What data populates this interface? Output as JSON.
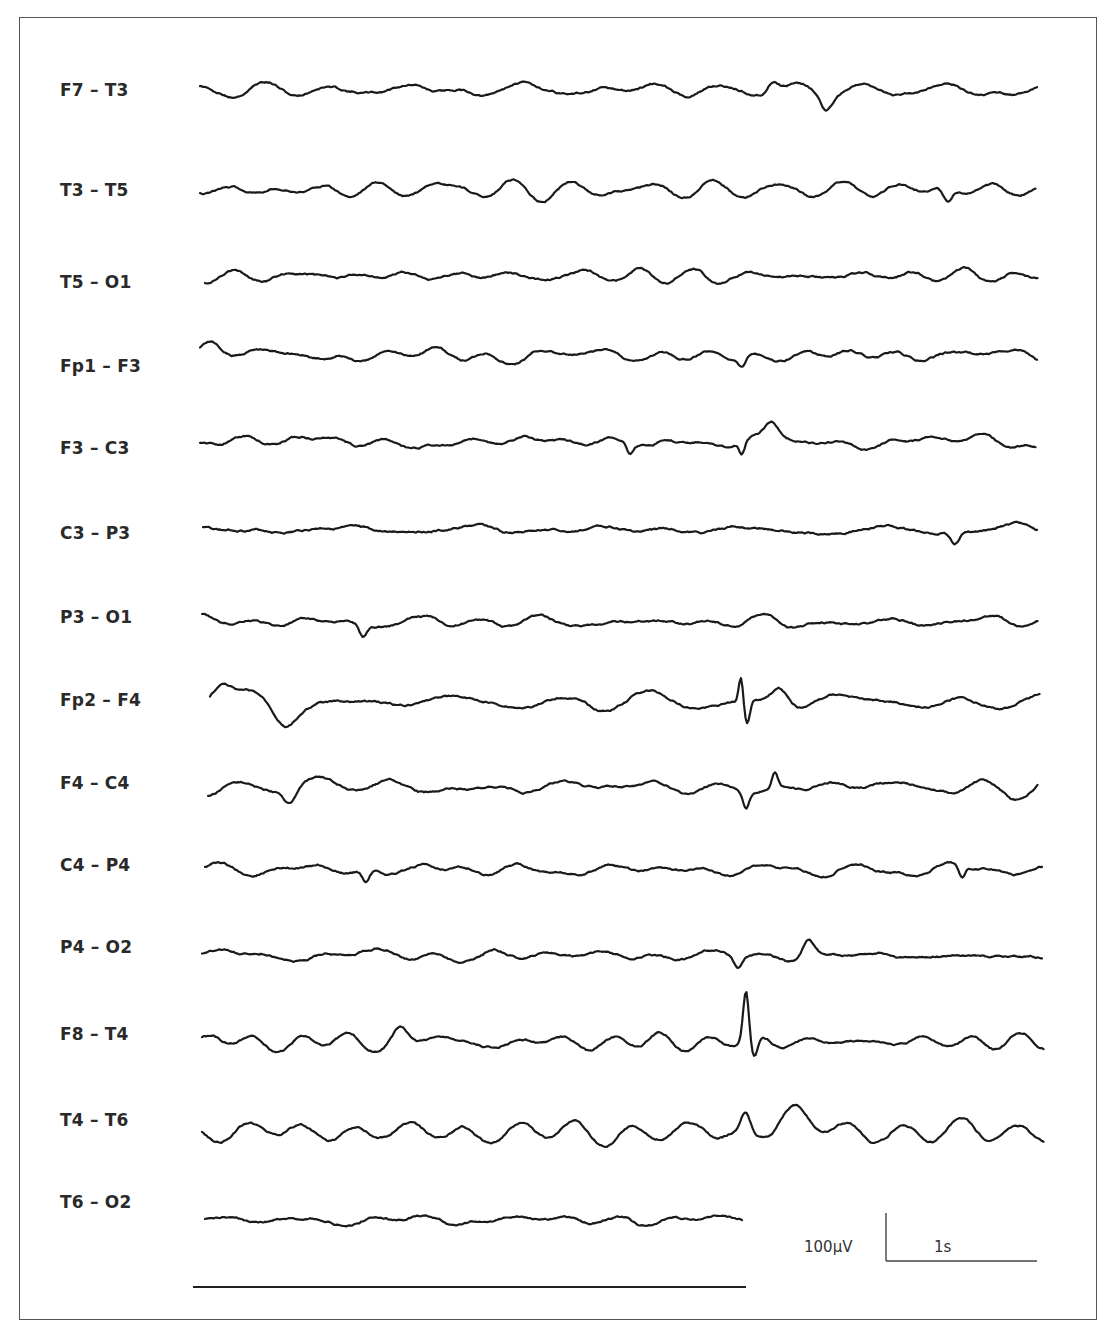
{
  "chart_data": {
    "type": "line",
    "title": "",
    "subtitle": "EEG bipolar montage (longitudinal) — 14 channels",
    "xlabel": "",
    "ylabel": "",
    "grid": false,
    "legend": "none",
    "scale_bar": {
      "amplitude_label": "100µV",
      "time_label": "1s",
      "amplitude_uV": 100,
      "time_s": 1
    },
    "series": [
      {
        "name": "F7 – T3",
        "baseline_y": 90,
        "amp": 9,
        "x0": 200,
        "x1": 1038,
        "seed": 11,
        "events": [
          {
            "x": 826,
            "dy": 14,
            "w": 8
          },
          {
            "x": 773,
            "dy": -12,
            "w": 8
          }
        ]
      },
      {
        "name": "T3 – T5",
        "baseline_y": 190,
        "amp": 9,
        "x0": 200,
        "x1": 1036,
        "seed": 23,
        "events": [
          {
            "x": 948,
            "dy": 14,
            "w": 6
          }
        ]
      },
      {
        "name": "T5 – O1",
        "baseline_y": 276,
        "amp": 6,
        "x0": 205,
        "x1": 1038,
        "seed": 37,
        "events": []
      },
      {
        "name": "Fp1 – F3",
        "baseline_y": 355,
        "amp": 8,
        "x0": 200,
        "x1": 1038,
        "seed": 41,
        "events": [
          {
            "x": 210,
            "dy": -14,
            "w": 14
          },
          {
            "x": 742,
            "dy": 10,
            "w": 5
          }
        ]
      },
      {
        "name": "F3 – C3",
        "baseline_y": 442,
        "amp": 9,
        "x0": 200,
        "x1": 1036,
        "seed": 53,
        "events": [
          {
            "x": 772,
            "dy": -20,
            "w": 10
          },
          {
            "x": 742,
            "dy": 12,
            "w": 4
          },
          {
            "x": 630,
            "dy": 10,
            "w": 4
          }
        ]
      },
      {
        "name": "C3 – P3",
        "baseline_y": 530,
        "amp": 6,
        "x0": 203,
        "x1": 1038,
        "seed": 67,
        "events": [
          {
            "x": 955,
            "dy": 12,
            "w": 6
          }
        ]
      },
      {
        "name": "P3 – O1",
        "baseline_y": 622,
        "amp": 7,
        "x0": 202,
        "x1": 1038,
        "seed": 79,
        "events": [
          {
            "x": 363,
            "dy": 12,
            "w": 5
          }
        ]
      },
      {
        "name": "Fp2 – F4",
        "baseline_y": 702,
        "amp": 9,
        "x0": 210,
        "x1": 1040,
        "seed": 83,
        "events": [
          {
            "x": 220,
            "dy": -18,
            "w": 14
          },
          {
            "x": 285,
            "dy": 18,
            "w": 16
          },
          {
            "x": 741,
            "dy": -24,
            "w": 3
          },
          {
            "x": 747,
            "dy": 24,
            "w": 4
          },
          {
            "x": 780,
            "dy": -18,
            "w": 12
          }
        ]
      },
      {
        "name": "F4 – C4",
        "baseline_y": 787,
        "amp": 9,
        "x0": 208,
        "x1": 1038,
        "seed": 97,
        "events": [
          {
            "x": 290,
            "dy": 14,
            "w": 8
          },
          {
            "x": 775,
            "dy": -14,
            "w": 4
          },
          {
            "x": 746,
            "dy": 14,
            "w": 4
          }
        ]
      },
      {
        "name": "C4 – P4",
        "baseline_y": 870,
        "amp": 7,
        "x0": 205,
        "x1": 1042,
        "seed": 101,
        "events": [
          {
            "x": 366,
            "dy": 12,
            "w": 5
          },
          {
            "x": 962,
            "dy": 12,
            "w": 4
          }
        ]
      },
      {
        "name": "P4 – O2",
        "baseline_y": 955,
        "amp": 7,
        "x0": 202,
        "x1": 1042,
        "seed": 113,
        "events": [
          {
            "x": 808,
            "dy": -18,
            "w": 8
          },
          {
            "x": 738,
            "dy": 12,
            "w": 6
          }
        ]
      },
      {
        "name": "F8 – T4",
        "baseline_y": 1042,
        "amp": 11,
        "x0": 202,
        "x1": 1044,
        "seed": 127,
        "events": [
          {
            "x": 746,
            "dy": -50,
            "w": 4
          },
          {
            "x": 754,
            "dy": 22,
            "w": 5
          },
          {
            "x": 400,
            "dy": -14,
            "w": 10
          }
        ]
      },
      {
        "name": "T4 – T6",
        "baseline_y": 1132,
        "amp": 9,
        "x0": 202,
        "x1": 1044,
        "seed": 131,
        "events": [
          {
            "x": 746,
            "dy": -18,
            "w": 6
          },
          {
            "x": 795,
            "dy": -22,
            "w": 20
          }
        ]
      },
      {
        "name": "T6 – O2",
        "baseline_y": 1220,
        "amp": 6,
        "x0": 205,
        "x1": 743,
        "seed": 139,
        "events": []
      }
    ]
  },
  "labels": {
    "channels": [
      "F7 – T3",
      "T3 – T5",
      "T5 – O1",
      "Fp1 – F3",
      "F3 – C3",
      "C3 – P3",
      "P3 – O1",
      "Fp2 – F4",
      "F4 – C4",
      "C4 – P4",
      "P4 – O2",
      "F8 – T4",
      "T4 – T6",
      "T6 – O2"
    ],
    "label_y": [
      90,
      190,
      282,
      366,
      448,
      533,
      617,
      700,
      783,
      865,
      947,
      1034,
      1120,
      1202
    ],
    "scale_amplitude": "100µV",
    "scale_time": "1s"
  },
  "colors": {
    "trace": "#1a1a1a",
    "frame": "#555555",
    "text": "#2a2a2a"
  }
}
